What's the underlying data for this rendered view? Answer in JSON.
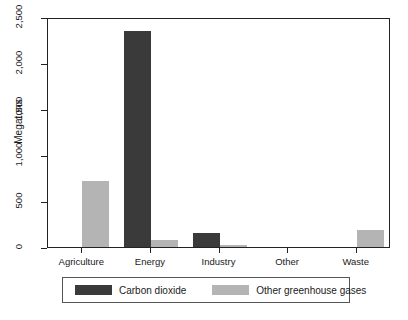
{
  "chart_data": {
    "type": "bar",
    "title": "",
    "xlabel": "",
    "ylabel": "Megatons",
    "categories": [
      "Agriculture",
      "Energy",
      "Industry",
      "Other",
      "Waste"
    ],
    "series": [
      {
        "name": "Carbon dioxide",
        "color": "#3a3a3a",
        "values": [
          0,
          2350,
          150,
          0,
          0
        ]
      },
      {
        "name": "Other greenhouse gases",
        "color": "#b4b4b4",
        "values": [
          720,
          80,
          20,
          0,
          180
        ]
      }
    ],
    "ylim": [
      0,
      2500
    ],
    "yticks": [
      0,
      500,
      1000,
      1500,
      2000,
      2500
    ],
    "ytick_labels": [
      "0",
      "500",
      "1,000",
      "1,500",
      "2,000",
      "2,500"
    ],
    "grid": false,
    "legend_position": "bottom"
  },
  "axis": {
    "y_title": "Megatons"
  },
  "legend": {
    "entries": [
      {
        "label": "Carbon dioxide",
        "color": "#3a3a3a"
      },
      {
        "label": "Other greenhouse gases",
        "color": "#b4b4b4"
      }
    ]
  }
}
